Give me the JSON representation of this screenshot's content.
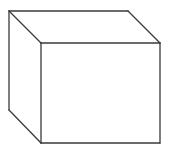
{
  "diagram": {
    "type": "wireframe-cube",
    "stroke_color": "#3a3a3a",
    "background": "#ffffff",
    "stroke_width": 1.3,
    "vertices": {
      "back_top_left": [
        9,
        11
      ],
      "back_top_right": [
        128,
        11
      ],
      "back_bottom_left": [
        9,
        110
      ],
      "front_top_left": [
        41,
        43
      ],
      "front_top_right": [
        160,
        43
      ],
      "front_bottom_left": [
        41,
        143
      ],
      "front_bottom_right": [
        160,
        143
      ]
    },
    "faces_visible": [
      "front",
      "top",
      "left"
    ]
  }
}
